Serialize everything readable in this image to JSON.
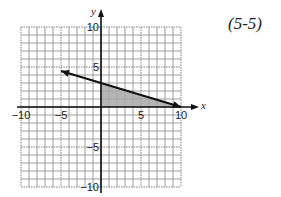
{
  "problem_ref": "(5-5)",
  "chart_data": {
    "type": "line",
    "title": "",
    "xlabel": "x",
    "ylabel": "y",
    "xlim": [
      -10,
      10
    ],
    "ylim": [
      -10,
      10
    ],
    "grid": true,
    "x_ticks": [
      {
        "value": -10,
        "label": "−10"
      },
      {
        "value": -5,
        "label": "−5"
      },
      {
        "value": 5,
        "label": "5"
      },
      {
        "value": 10,
        "label": "10"
      }
    ],
    "y_ticks": [
      {
        "value": 10,
        "label": "10"
      },
      {
        "value": 5,
        "label": "5"
      },
      {
        "value": -5,
        "label": "−5"
      },
      {
        "value": -10,
        "label": "−10"
      }
    ],
    "series": [
      {
        "name": "boundary line",
        "equation": "y = -0.3x + 3",
        "points": [
          [
            -5,
            4.5
          ],
          [
            10,
            0
          ]
        ],
        "arrows": "both",
        "color": "#111111"
      }
    ],
    "shaded_region": {
      "vertices": [
        [
          0,
          0
        ],
        [
          0,
          3
        ],
        [
          10,
          0
        ]
      ],
      "color": "#a8a8a8"
    }
  }
}
